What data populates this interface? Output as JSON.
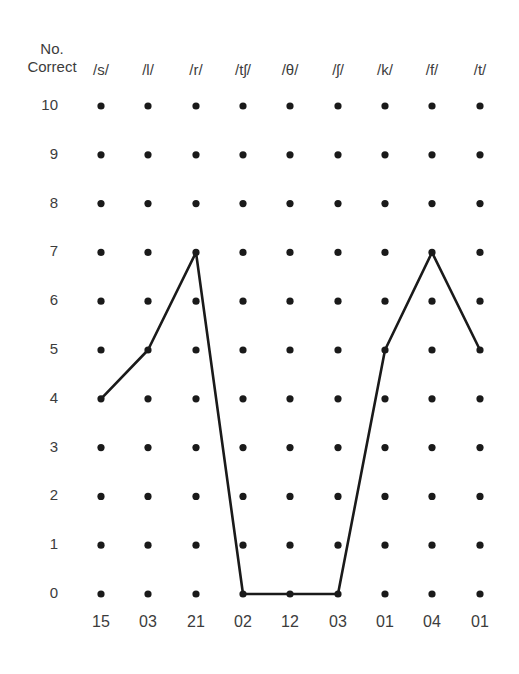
{
  "chart_data": {
    "type": "line",
    "title": "",
    "ylabel": "No. Correct",
    "xlabel": "",
    "categories": [
      "/s/",
      "/l/",
      "/r/",
      "/tʃ/",
      "/θ/",
      "/ʃ/",
      "/k/",
      "/f/",
      "/t/"
    ],
    "bottom_labels": [
      "15",
      "03",
      "21",
      "02",
      "12",
      "03",
      "01",
      "04",
      "01"
    ],
    "y_ticks": [
      10,
      9,
      8,
      7,
      6,
      5,
      4,
      3,
      2,
      1,
      0
    ],
    "ylim": [
      0,
      10
    ],
    "series": [
      {
        "name": "No. Correct",
        "values": [
          4,
          5,
          7,
          0,
          0,
          0,
          5,
          7,
          5
        ]
      }
    ],
    "grid": "dot-grid",
    "legend": "none"
  },
  "ylabel_lines": [
    "No.",
    "Correct"
  ],
  "colors": {
    "ink": "#1a1a1a",
    "text": "#3c3c3c",
    "background": "#ffffff"
  }
}
